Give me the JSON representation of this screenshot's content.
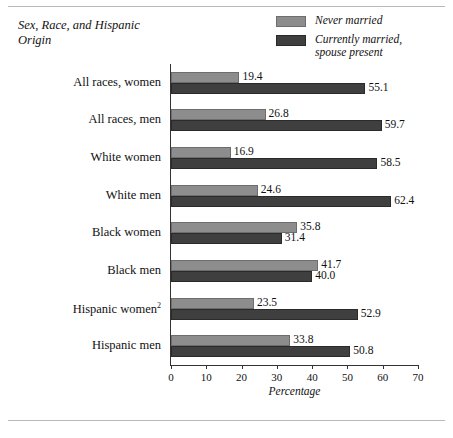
{
  "chart_data": {
    "type": "bar",
    "orientation": "horizontal",
    "title": "Sex, Race, and Hispanic Origin",
    "xlabel": "Percentage",
    "ylabel": "",
    "xlim": [
      0,
      70
    ],
    "xticks": [
      0,
      10,
      20,
      30,
      40,
      50,
      60,
      70
    ],
    "grid": false,
    "legend_position": "top-right",
    "categories": [
      "All races, women",
      "All races, men",
      "White women",
      "White men",
      "Black women",
      "Black men",
      "Hispanic women",
      "Hispanic men"
    ],
    "category_footnotes": [
      "",
      "",
      "",
      "",
      "",
      "",
      "2",
      ""
    ],
    "series": [
      {
        "name": "Never married",
        "color": "#8d8d8d",
        "values": [
          19.4,
          26.8,
          16.9,
          24.6,
          35.8,
          41.7,
          23.5,
          33.8
        ]
      },
      {
        "name": "Currently married, spouse present",
        "color": "#3f3f3f",
        "values": [
          55.1,
          59.7,
          58.5,
          62.4,
          31.4,
          40.0,
          52.9,
          50.8
        ]
      }
    ]
  },
  "legend": {
    "items": [
      {
        "label": "Never married",
        "color": "#8d8d8d"
      },
      {
        "label": "Currently married, spouse present",
        "color": "#3f3f3f"
      }
    ]
  }
}
